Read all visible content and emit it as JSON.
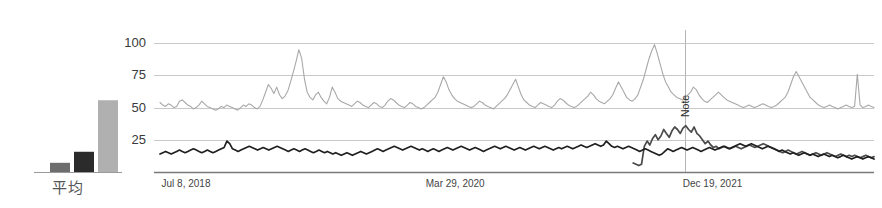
{
  "bar_chart": {
    "axis_label": "平均",
    "bars": [
      {
        "name": "bar-1",
        "value": 10,
        "color": "#6d6d6d"
      },
      {
        "name": "bar-2",
        "value": 22,
        "color": "#2b2b2b"
      },
      {
        "name": "bar-3",
        "value": 78,
        "color": "#b0b0b0"
      }
    ],
    "axis_color": "#9a9a9a"
  },
  "line_chart": {
    "y_ticks": [
      "100",
      "75",
      "50",
      "25"
    ],
    "y_values": [
      100,
      75,
      50,
      25
    ],
    "x_ticks": [
      "Jul 8, 2018",
      "Mar 29, 2020",
      "Dec 19, 2021"
    ],
    "annotation": "Note",
    "grid_color": "#c8c8c8",
    "axis_color": "#7a7a7a",
    "series_colors": {
      "upper_light": "#a8a8a8",
      "mid_dark": "#4a4a4a",
      "lower_dark": "#1f1f1f"
    }
  },
  "chart_data": {
    "type": "line",
    "title": "",
    "xlabel": "",
    "ylabel": "",
    "ylim": [
      0,
      108
    ],
    "grid": true,
    "legend": "none",
    "annotations": [
      {
        "text": "Note",
        "x_label": "Dec 19, 2021",
        "orientation": "vertical",
        "x_fraction": 0.735
      }
    ],
    "x_tick_labels": [
      "Jul 8, 2018",
      "Mar 29, 2020",
      "Dec 19, 2021"
    ],
    "x_tick_fractions": [
      0.005,
      0.375,
      0.735
    ],
    "y_tick_labels": [
      "25",
      "50",
      "75",
      "100"
    ],
    "series": [
      {
        "name": "upper_light",
        "color": "#a8a8a8",
        "values": [
          54,
          52,
          51,
          53,
          52,
          50,
          51,
          55,
          56,
          54,
          52,
          51,
          49,
          50,
          52,
          55,
          53,
          51,
          50,
          49,
          48,
          49,
          51,
          50,
          52,
          51,
          50,
          49,
          48,
          50,
          52,
          51,
          53,
          52,
          50,
          49,
          51,
          56,
          62,
          68,
          65,
          61,
          66,
          60,
          57,
          59,
          63,
          70,
          78,
          86,
          95,
          88,
          72,
          62,
          58,
          56,
          60,
          62,
          58,
          55,
          53,
          58,
          66,
          62,
          57,
          55,
          54,
          53,
          52,
          51,
          53,
          55,
          54,
          52,
          51,
          50,
          52,
          54,
          53,
          51,
          50,
          52,
          55,
          57,
          56,
          54,
          52,
          51,
          50,
          52,
          54,
          53,
          51,
          50,
          49,
          50,
          52,
          54,
          56,
          58,
          62,
          68,
          74,
          70,
          64,
          60,
          57,
          55,
          54,
          53,
          52,
          51,
          50,
          51,
          53,
          55,
          54,
          52,
          51,
          50,
          49,
          51,
          53,
          55,
          57,
          60,
          64,
          68,
          72,
          66,
          60,
          56,
          54,
          52,
          51,
          50,
          52,
          54,
          53,
          52,
          51,
          50,
          52,
          55,
          57,
          56,
          54,
          52,
          51,
          50,
          51,
          53,
          55,
          57,
          59,
          62,
          60,
          57,
          55,
          54,
          53,
          55,
          57,
          60,
          65,
          70,
          66,
          62,
          58,
          56,
          55,
          57,
          60,
          66,
          72,
          80,
          88,
          94,
          99,
          92,
          84,
          76,
          70,
          66,
          62,
          60,
          58,
          57,
          56,
          58,
          60,
          62,
          66,
          64,
          60,
          57,
          55,
          54,
          56,
          58,
          60,
          62,
          60,
          58,
          56,
          55,
          54,
          53,
          52,
          51,
          50,
          51,
          52,
          51,
          50,
          51,
          52,
          53,
          52,
          51,
          50,
          51,
          52,
          54,
          56,
          58,
          62,
          68,
          74,
          78,
          74,
          70,
          66,
          62,
          58,
          56,
          54,
          52,
          51,
          50,
          51,
          52,
          51,
          50,
          49,
          50,
          51,
          52,
          51,
          50,
          51,
          76,
          52,
          50,
          51,
          52,
          51,
          50
        ]
      },
      {
        "name": "mid_dark",
        "color": "#4a4a4a",
        "values": [
          null,
          null,
          null,
          null,
          null,
          null,
          null,
          null,
          null,
          null,
          null,
          null,
          null,
          null,
          null,
          null,
          null,
          null,
          null,
          null,
          null,
          null,
          null,
          null,
          null,
          null,
          null,
          null,
          null,
          null,
          null,
          null,
          null,
          null,
          null,
          null,
          null,
          null,
          null,
          null,
          null,
          null,
          null,
          null,
          null,
          null,
          null,
          null,
          null,
          null,
          null,
          null,
          null,
          null,
          null,
          null,
          null,
          null,
          null,
          null,
          null,
          null,
          null,
          null,
          null,
          null,
          null,
          null,
          null,
          null,
          null,
          null,
          null,
          null,
          null,
          null,
          null,
          null,
          null,
          null,
          null,
          null,
          null,
          null,
          null,
          null,
          null,
          null,
          null,
          null,
          null,
          null,
          null,
          null,
          null,
          null,
          null,
          null,
          null,
          null,
          null,
          null,
          null,
          null,
          null,
          null,
          null,
          null,
          null,
          null,
          null,
          null,
          null,
          null,
          null,
          null,
          null,
          null,
          null,
          null,
          null,
          null,
          null,
          null,
          null,
          null,
          null,
          null,
          null,
          null,
          null,
          null,
          null,
          null,
          null,
          null,
          null,
          null,
          null,
          null,
          null,
          null,
          null,
          null,
          null,
          null,
          null,
          null,
          null,
          null,
          null,
          null,
          null,
          null,
          null,
          null,
          null,
          null,
          null,
          null,
          null,
          null,
          null,
          null,
          null,
          null,
          null,
          null,
          null,
          null,
          null,
          7,
          6,
          5,
          6,
          20,
          24,
          21,
          26,
          29,
          25,
          28,
          33,
          30,
          27,
          32,
          35,
          33,
          30,
          34,
          36,
          33,
          31,
          35,
          30,
          28,
          25,
          22,
          24,
          21,
          19,
          20,
          18,
          19,
          20,
          19,
          18,
          19,
          20,
          19,
          18,
          19,
          20,
          21,
          20,
          19,
          20,
          21,
          22,
          21,
          20,
          19,
          18,
          17,
          16,
          15,
          16,
          17,
          16,
          15,
          14,
          15,
          16,
          15,
          14,
          13,
          14,
          15,
          14,
          13,
          14,
          15,
          14,
          13,
          12,
          13,
          14,
          13,
          12,
          13,
          12,
          13,
          12,
          11,
          12,
          13,
          12,
          11,
          12
        ]
      },
      {
        "name": "lower_dark",
        "color": "#1f1f1f",
        "values": [
          14,
          15,
          16,
          15,
          14,
          15,
          16,
          17,
          16,
          15,
          16,
          17,
          18,
          17,
          16,
          15,
          16,
          17,
          16,
          15,
          16,
          17,
          18,
          19,
          24,
          22,
          18,
          17,
          16,
          17,
          18,
          19,
          20,
          19,
          18,
          17,
          18,
          19,
          18,
          17,
          18,
          19,
          20,
          19,
          18,
          17,
          16,
          17,
          18,
          17,
          16,
          17,
          18,
          17,
          16,
          15,
          16,
          17,
          16,
          15,
          16,
          15,
          14,
          15,
          14,
          13,
          14,
          15,
          14,
          13,
          14,
          15,
          16,
          15,
          14,
          15,
          16,
          17,
          18,
          17,
          16,
          17,
          18,
          19,
          20,
          19,
          18,
          17,
          18,
          19,
          20,
          19,
          18,
          17,
          18,
          17,
          16,
          17,
          18,
          17,
          16,
          17,
          18,
          19,
          18,
          17,
          18,
          19,
          20,
          19,
          18,
          17,
          18,
          19,
          18,
          17,
          16,
          17,
          18,
          19,
          20,
          19,
          18,
          19,
          20,
          19,
          18,
          17,
          18,
          19,
          18,
          17,
          18,
          19,
          20,
          19,
          18,
          19,
          20,
          19,
          18,
          17,
          18,
          19,
          18,
          19,
          20,
          19,
          18,
          19,
          20,
          21,
          20,
          19,
          20,
          21,
          22,
          21,
          20,
          21,
          24,
          22,
          20,
          19,
          20,
          19,
          18,
          19,
          20,
          19,
          18,
          17,
          16,
          17,
          18,
          17,
          16,
          15,
          14,
          13,
          14,
          16,
          18,
          17,
          16,
          17,
          18,
          19,
          18,
          17,
          18,
          19,
          18,
          17,
          16,
          17,
          18,
          19,
          18,
          17,
          18,
          19,
          20,
          19,
          18,
          19,
          20,
          21,
          22,
          21,
          20,
          21,
          22,
          21,
          20,
          19,
          18,
          19,
          20,
          19,
          18,
          17,
          16,
          17,
          16,
          15,
          14,
          15,
          14,
          13,
          14,
          15,
          14,
          13,
          14,
          13,
          12,
          13,
          14,
          13,
          12,
          13,
          12,
          11,
          12,
          13,
          12,
          11,
          10,
          11,
          12,
          11,
          10,
          11,
          12,
          11,
          10
        ]
      }
    ]
  }
}
